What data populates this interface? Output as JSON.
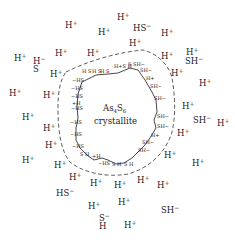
{
  "diagram": {
    "core": {
      "formula": "As4S6",
      "formula_base": "As",
      "sub1": "4",
      "s": "S",
      "sub2": "6",
      "label": "crystallite"
    },
    "outer_ions": [
      {
        "t": "H",
        "s": "+",
        "x": 65,
        "y": 28
      },
      {
        "t": "H",
        "s": "+",
        "x": 117,
        "y": 20
      },
      {
        "t": "H",
        "s": "+",
        "x": 98,
        "y": 35
      },
      {
        "t": "HS",
        "s": "−",
        "x": 133,
        "y": 31
      },
      {
        "t": "H",
        "s": "+",
        "x": 161,
        "y": 36
      },
      {
        "t": "H",
        "s": "+",
        "x": 129,
        "y": 46
      },
      {
        "t": "H",
        "s": "+",
        "x": 14,
        "y": 61
      },
      {
        "t": "H",
        "s": "+",
        "x": 55,
        "y": 56
      },
      {
        "t": "H",
        "s": "+",
        "x": 87,
        "y": 56
      },
      {
        "t": "H",
        "s": "+",
        "x": 161,
        "y": 59
      },
      {
        "t": "H",
        "s": "+",
        "x": 186,
        "y": 55
      },
      {
        "t": "SH",
        "s": "−",
        "x": 185,
        "y": 64
      },
      {
        "t": "H",
        "s": "+",
        "x": 50,
        "y": 77
      },
      {
        "t": "H",
        "s": "+",
        "x": 171,
        "y": 76
      },
      {
        "t": "H",
        "s": "+",
        "x": 199,
        "y": 86
      },
      {
        "t": "H",
        "s": "+",
        "x": 9,
        "y": 96
      },
      {
        "t": "H",
        "s": "+",
        "x": 43,
        "y": 98
      },
      {
        "t": "H",
        "s": "+",
        "x": 182,
        "y": 109
      },
      {
        "t": "H",
        "s": "+",
        "x": 22,
        "y": 120
      },
      {
        "t": "SH",
        "s": "−",
        "x": 193,
        "y": 123
      },
      {
        "t": "H",
        "s": "+",
        "x": 217,
        "y": 126
      },
      {
        "t": "H",
        "s": "+",
        "x": 43,
        "y": 131
      },
      {
        "t": "H",
        "s": "+",
        "x": 177,
        "y": 136
      },
      {
        "t": "H",
        "s": "+",
        "x": 45,
        "y": 148
      },
      {
        "t": "H",
        "s": "+",
        "x": 22,
        "y": 163
      },
      {
        "t": "H",
        "s": "+",
        "x": 164,
        "y": 158
      },
      {
        "t": "H",
        "s": "+",
        "x": 192,
        "y": 166
      },
      {
        "t": "H",
        "s": "+",
        "x": 54,
        "y": 168
      },
      {
        "t": "H",
        "s": "+",
        "x": 69,
        "y": 180
      },
      {
        "t": "H",
        "s": "+",
        "x": 90,
        "y": 186
      },
      {
        "t": "H",
        "s": "+",
        "x": 114,
        "y": 188
      },
      {
        "t": "H",
        "s": "+",
        "x": 137,
        "y": 183
      },
      {
        "t": "H",
        "s": "+",
        "x": 157,
        "y": 188
      },
      {
        "t": "HS",
        "s": "−",
        "x": 56,
        "y": 196
      },
      {
        "t": "H",
        "s": "+",
        "x": 88,
        "y": 209
      },
      {
        "t": "H",
        "s": "+",
        "x": 118,
        "y": 205
      },
      {
        "t": "SH",
        "s": "−",
        "x": 161,
        "y": 213
      },
      {
        "t": "H",
        "s": "+",
        "x": 124,
        "y": 228
      }
    ],
    "stacked_ions": [
      {
        "top": "H",
        "top_s": "−",
        "bottom": "S",
        "x": 33,
        "y": 64
      },
      {
        "top": "S",
        "top_s": "−",
        "bottom": "H",
        "x": 99,
        "y": 221
      }
    ],
    "surface_groups_left": [
      "−HS",
      "−HS",
      "−HS",
      "+H",
      "−HS",
      "−HS",
      "−HS",
      "−HS"
    ],
    "surface_groups_right": [
      "SH−",
      "SH−",
      "SH−",
      "SH−",
      "SH−",
      "SH−",
      "H+",
      "SH−",
      "SH−"
    ],
    "colors": {
      "ink": "#222222",
      "background": "#ffffff"
    }
  }
}
